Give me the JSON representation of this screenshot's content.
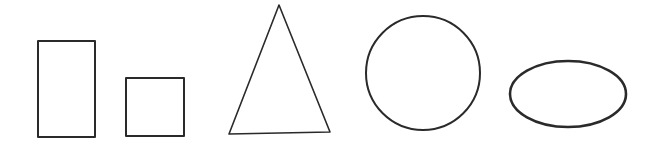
{
  "canvas": {
    "width": 656,
    "height": 151,
    "background": "#ffffff",
    "stroke_color": "#2a2a2a"
  },
  "shapes": [
    {
      "name": "rectangle",
      "type": "rect",
      "x": 38,
      "y": 41,
      "width": 57,
      "height": 96,
      "stroke_width": 2
    },
    {
      "name": "square",
      "type": "rect",
      "x": 126,
      "y": 78,
      "width": 58,
      "height": 58,
      "stroke_width": 2
    },
    {
      "name": "triangle",
      "type": "polygon",
      "points": "279,5 229,134 330,132",
      "stroke_width": 1.6
    },
    {
      "name": "circle",
      "type": "circle",
      "cx": 423,
      "cy": 73,
      "r": 57,
      "stroke_width": 2
    },
    {
      "name": "ellipse",
      "type": "ellipse",
      "cx": 568,
      "cy": 94,
      "rx": 58,
      "ry": 33,
      "stroke_width": 2.6
    }
  ]
}
